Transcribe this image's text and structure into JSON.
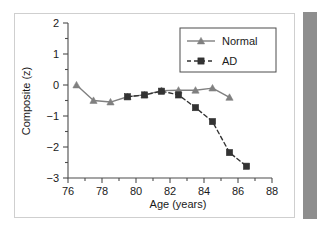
{
  "figure": {
    "background_color": "#ffffff",
    "frame_color": "#cfcfcf",
    "right_bar_color": "#8e8e8e"
  },
  "chart_data": {
    "type": "line",
    "title": "",
    "subtitle": "",
    "xlabel": "Age (years)",
    "ylabel": "Composite (z)",
    "xlim": [
      76,
      88
    ],
    "ylim": [
      -3,
      2
    ],
    "xticks": [
      76,
      78,
      80,
      82,
      84,
      86,
      88
    ],
    "xtick_labels": [
      "76",
      "78",
      "80",
      "82",
      "84",
      "86",
      "88"
    ],
    "yticks": [
      2,
      1,
      0,
      -1,
      -2,
      -3
    ],
    "ytick_labels": [
      "2",
      "1",
      "0",
      "−1",
      "−2",
      "−3"
    ],
    "minor_xtick_interval": 1,
    "minor_ytick_interval": 0.5,
    "grid": false,
    "legend_position": "upper right",
    "series": [
      {
        "name": "Normal",
        "color": "#808080",
        "marker": "triangle",
        "linestyle": "solid",
        "x": [
          76.5,
          77.5,
          78.5,
          79.5,
          80.5,
          81.5,
          82.5,
          83.5,
          84.5,
          85.5
        ],
        "values": [
          0.0,
          -0.5,
          -0.55,
          -0.38,
          -0.32,
          -0.18,
          -0.17,
          -0.17,
          -0.1,
          -0.4
        ]
      },
      {
        "name": "AD",
        "color": "#333333",
        "marker": "square",
        "linestyle": "dashed",
        "x": [
          79.5,
          80.5,
          81.5,
          82.5,
          83.5,
          84.5,
          85.5,
          86.5
        ],
        "values": [
          -0.38,
          -0.32,
          -0.2,
          -0.32,
          -0.73,
          -1.18,
          -2.18,
          -2.62
        ]
      }
    ]
  },
  "legend": {
    "entries": [
      {
        "label": "Normal"
      },
      {
        "label": "AD"
      }
    ]
  }
}
